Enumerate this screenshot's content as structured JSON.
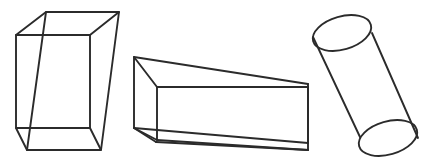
{
  "figure": {
    "background_color": "#ffffff",
    "stroke_color": "#2b2b2b",
    "stroke_width": 1.9,
    "width": 432,
    "height": 161,
    "style": "wireframe line drawing, transparent solids with all hidden edges visible"
  },
  "shapes": [
    {
      "id": "rectangular-prism",
      "name": "Rectangular prism",
      "type": "cuboid",
      "projection": "oblique",
      "faces": 6,
      "edges": 12,
      "vertices": 8,
      "points": {
        "back_top_left": [
          16,
          35
        ],
        "back_top_right": [
          90,
          35
        ],
        "back_bottom_left": [
          16,
          128
        ],
        "back_bottom_right": [
          90,
          128
        ],
        "front_top_left": [
          46,
          12
        ],
        "front_top_right": [
          119,
          12
        ],
        "front_bottom_left": [
          27,
          150
        ],
        "front_bottom_right": [
          101,
          150
        ]
      }
    },
    {
      "id": "elongated-prism",
      "name": "Elongated rectangular prism",
      "type": "cuboid",
      "projection": "perspective",
      "faces": 6,
      "edges": 12,
      "vertices": 8,
      "points": {
        "near_top_left": [
          134,
          57
        ],
        "near_bottom_left": [
          134,
          128
        ],
        "front_top_left": [
          157,
          87
        ],
        "front_bottom_left": [
          157,
          140
        ],
        "far_top_right": [
          308,
          84
        ],
        "far_bottom_right": [
          308,
          150
        ],
        "front_top_right": [
          308,
          87
        ],
        "front_bottom_right": [
          308,
          143
        ],
        "near_bottom_corner": [
          156,
          142
        ]
      }
    },
    {
      "id": "cylinder",
      "name": "Cylinder",
      "type": "cylinder",
      "projection": "oblique tilted",
      "faces": 3,
      "edges": 2,
      "vertices": 0,
      "points": {
        "top_ellipse_center": [
          342,
          33
        ],
        "top_ellipse_rx": 30,
        "top_ellipse_ry": 16.5,
        "bottom_ellipse_center": [
          388,
          138
        ],
        "bottom_ellipse_rx": 30,
        "bottom_ellipse_ry": 16.5,
        "left_side_top": [
          313,
          37
        ],
        "left_side_bottom": [
          360,
          137
        ],
        "right_side_top": [
          372,
          33
        ],
        "right_side_bottom": [
          418,
          138
        ]
      },
      "tilt_degrees": -24
    }
  ]
}
